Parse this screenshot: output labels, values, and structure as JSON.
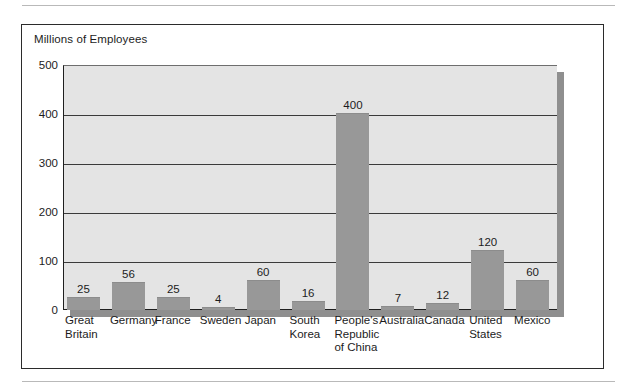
{
  "figure": {
    "title": "Millions of Employees"
  },
  "chart_data": {
    "type": "bar",
    "title": "Millions of Employees",
    "xlabel": "",
    "ylabel": "Millions of Employees",
    "ylim": [
      0,
      500
    ],
    "yticks": [
      0,
      100,
      200,
      300,
      400,
      500
    ],
    "grid": true,
    "legend": "none",
    "categories": [
      "Great\nBritain",
      "Germany",
      "France",
      "Sweden",
      "Japan",
      "South\nKorea",
      "People's\nRepublic\nof China",
      "Australia",
      "Canada",
      "United\nStates",
      "Mexico"
    ],
    "values": [
      25,
      56,
      25,
      4,
      60,
      16,
      400,
      7,
      12,
      120,
      60
    ],
    "value_labels": [
      "25",
      "56",
      "25",
      "4",
      "60",
      "16",
      "400",
      "7",
      "12",
      "120",
      "60"
    ],
    "bar_color": "#989898",
    "plot_background": "#e4e4e4"
  }
}
